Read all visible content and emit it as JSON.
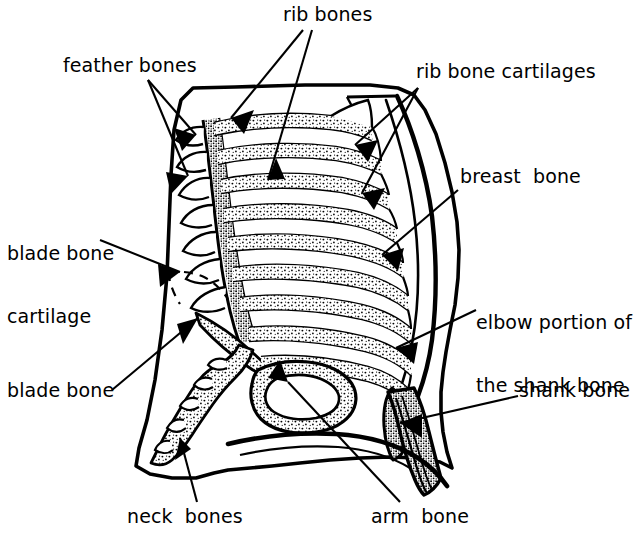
{
  "figure": {
    "background_color": "#ffffff",
    "ink_color": "#000000",
    "width": 637,
    "height": 535
  },
  "labels": {
    "rib_bones": "rib bones",
    "feather_bones": "feather bones",
    "rib_bone_cartilages": "rib bone cartilages",
    "breast_bone": "breast  bone",
    "blade_bone_cartilage_line1": "blade bone",
    "blade_bone_cartilage_line2": "cartilage",
    "elbow_portion_line1": "elbow portion of",
    "elbow_portion_line2": "the shank bone",
    "blade_bone": "blade bone",
    "shank_bone": "shank bone",
    "neck_bones": "neck  bones",
    "arm_bone": "arm  bone"
  },
  "callouts": [
    {
      "name": "rib-bones",
      "text": "rib bones",
      "arrow_count": 2,
      "position": "top-center"
    },
    {
      "name": "feather-bones",
      "text": "feather bones",
      "arrow_count": 2,
      "position": "top-left"
    },
    {
      "name": "rib-bone-cartilages",
      "text": "rib bone cartilages",
      "arrow_count": 2,
      "position": "top-right"
    },
    {
      "name": "breast-bone",
      "text": "breast  bone",
      "arrow_count": 1,
      "position": "right"
    },
    {
      "name": "blade-bone-cartilage",
      "text": "blade bone cartilage",
      "arrow_count": 1,
      "position": "left"
    },
    {
      "name": "elbow-portion",
      "text": "elbow portion of the shank bone",
      "arrow_count": 1,
      "position": "right"
    },
    {
      "name": "blade-bone",
      "text": "blade bone",
      "arrow_count": 1,
      "position": "left"
    },
    {
      "name": "shank-bone",
      "text": "shank bone",
      "arrow_count": 1,
      "position": "right"
    },
    {
      "name": "neck-bones",
      "text": "neck  bones",
      "arrow_count": 1,
      "position": "bottom-left"
    },
    {
      "name": "arm-bone",
      "text": "arm  bone",
      "arrow_count": 1,
      "position": "bottom-center"
    }
  ]
}
